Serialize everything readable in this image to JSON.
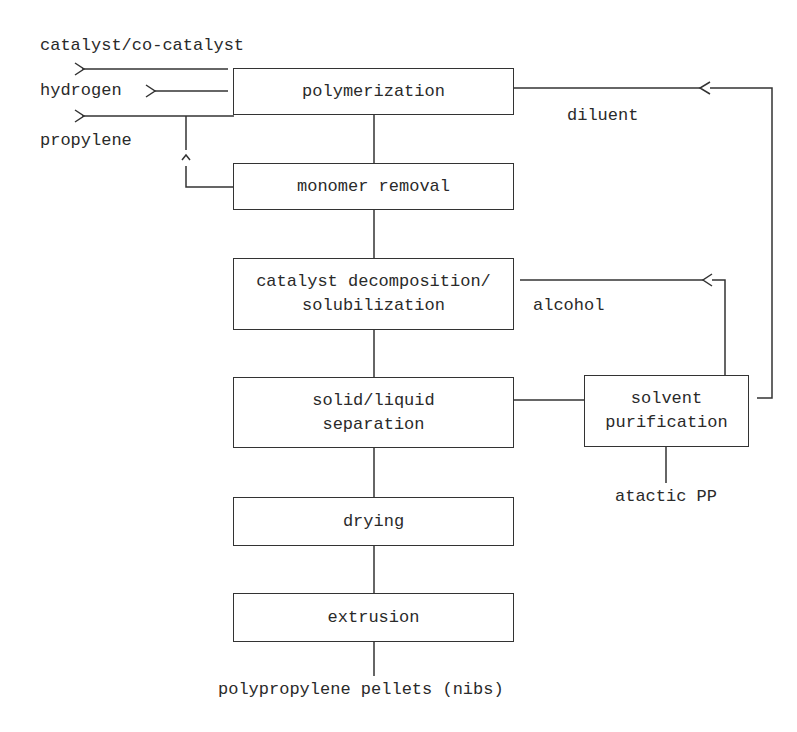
{
  "diagram": {
    "type": "process-flowsheet",
    "inputs": [
      {
        "id": "catalyst",
        "label": "catalyst/co-catalyst"
      },
      {
        "id": "hydrogen",
        "label": "hydrogen"
      },
      {
        "id": "propylene",
        "label": "propylene"
      }
    ],
    "units": [
      {
        "id": "polymerization",
        "label": "polymerization"
      },
      {
        "id": "monomer_removal",
        "label": "monomer removal"
      },
      {
        "id": "catalyst_decomposition",
        "label": "catalyst decomposition/\nsolubilization"
      },
      {
        "id": "separation",
        "label": "solid/liquid\nseparation"
      },
      {
        "id": "drying",
        "label": "drying"
      },
      {
        "id": "extrusion",
        "label": "extrusion"
      },
      {
        "id": "solvent_purification",
        "label": "solvent\npurification"
      }
    ],
    "streams": [
      {
        "id": "diluent",
        "label": "diluent",
        "from": "solvent_purification",
        "to": "polymerization"
      },
      {
        "id": "alcohol",
        "label": "alcohol",
        "from": "solvent_purification",
        "to": "catalyst_decomposition"
      },
      {
        "id": "atactic",
        "label": "atactic PP",
        "from": "solvent_purification",
        "to": "output"
      },
      {
        "id": "monomer_recycle",
        "label": "",
        "from": "monomer_removal",
        "to": "propylene feed"
      }
    ],
    "output": {
      "label": "polypropylene pellets (nibs)"
    }
  },
  "arrows": {
    "right": ">",
    "left": "<",
    "up": "^"
  }
}
